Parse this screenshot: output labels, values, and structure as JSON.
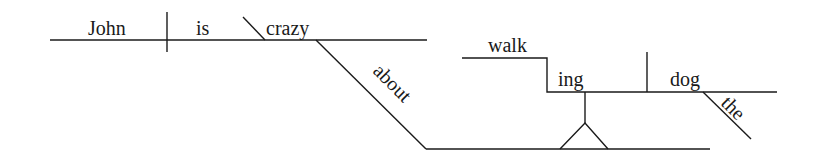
{
  "diagram": {
    "type": "reed-kellogg sentence diagram",
    "sentence": "John is crazy about walking the dog",
    "words": {
      "subject": "John",
      "verb": "is",
      "predicate_adjective": "crazy",
      "preposition": "about",
      "gerund_stem": "walk",
      "gerund_suffix": "ing",
      "gerund_object": "dog",
      "article": "the"
    },
    "colors": {
      "line": "#1a1a1a",
      "text": "#1a1a1a",
      "background": "#ffffff"
    }
  }
}
